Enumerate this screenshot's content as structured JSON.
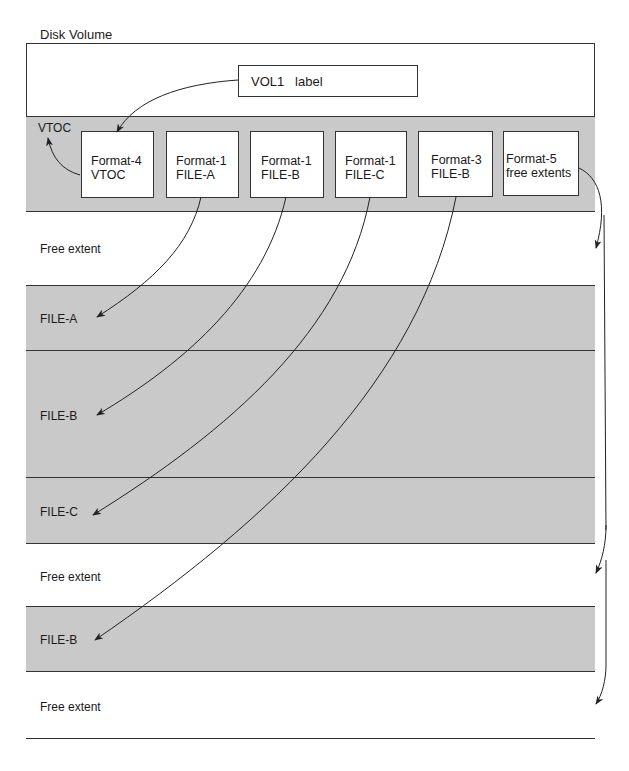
{
  "diagram": {
    "title": "Disk Volume",
    "vol1_label": {
      "name": "VOL1",
      "text": "label"
    },
    "vtoc": {
      "label": "VTOC",
      "dscbs": [
        {
          "line1": "Format-4",
          "line2": "VTOC"
        },
        {
          "line1": "Format-1",
          "line2": "FILE-A"
        },
        {
          "line1": "Format-1",
          "line2": "FILE-B"
        },
        {
          "line1": "Format-1",
          "line2": "FILE-C"
        },
        {
          "line1": "Format-3",
          "line2": "FILE-B"
        },
        {
          "line1": "Format-5",
          "line2": "free extents"
        }
      ]
    },
    "extents": [
      {
        "label": "Free extent",
        "type": "free"
      },
      {
        "label": "FILE-A",
        "type": "file"
      },
      {
        "label": "FILE-B",
        "type": "file"
      },
      {
        "label": "FILE-C",
        "type": "file"
      },
      {
        "label": "Free extent",
        "type": "free"
      },
      {
        "label": "FILE-B",
        "type": "file"
      },
      {
        "label": "Free extent",
        "type": "free"
      }
    ],
    "pointers": [
      {
        "from": "VOL1 label",
        "to": "Format-4 VTOC"
      },
      {
        "from": "Format-4 VTOC",
        "to": "VTOC"
      },
      {
        "from": "Format-1 FILE-A",
        "to": "FILE-A"
      },
      {
        "from": "Format-1 FILE-B",
        "to": "FILE-B"
      },
      {
        "from": "Format-1 FILE-C",
        "to": "FILE-C"
      },
      {
        "from": "Format-3 FILE-B",
        "to": "FILE-B (second extent)"
      },
      {
        "from": "Format-5 free extents",
        "to": "Free extent (x3)"
      }
    ],
    "colors": {
      "free": "#ffffff",
      "file": "#c9c9c9",
      "line": "#333333"
    }
  }
}
